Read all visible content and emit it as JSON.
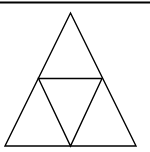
{
  "diagram": {
    "type": "subdivided-triangle",
    "colors": {
      "stroke": "#000000",
      "background": "#ffffff"
    },
    "top_rule": {
      "x1": 0,
      "y1": 2.5,
      "x2": 150,
      "y2": 2.5,
      "width": 2.2
    },
    "vertices": {
      "apex": [
        70.5,
        13
      ],
      "bottom_left": [
        5,
        146
      ],
      "bottom_right": [
        136,
        146
      ],
      "mid_left": [
        38.5,
        78.5
      ],
      "mid_right": [
        102,
        78.5
      ],
      "mid_bottom": [
        70.5,
        146
      ]
    },
    "stroke_width": 1.4
  }
}
